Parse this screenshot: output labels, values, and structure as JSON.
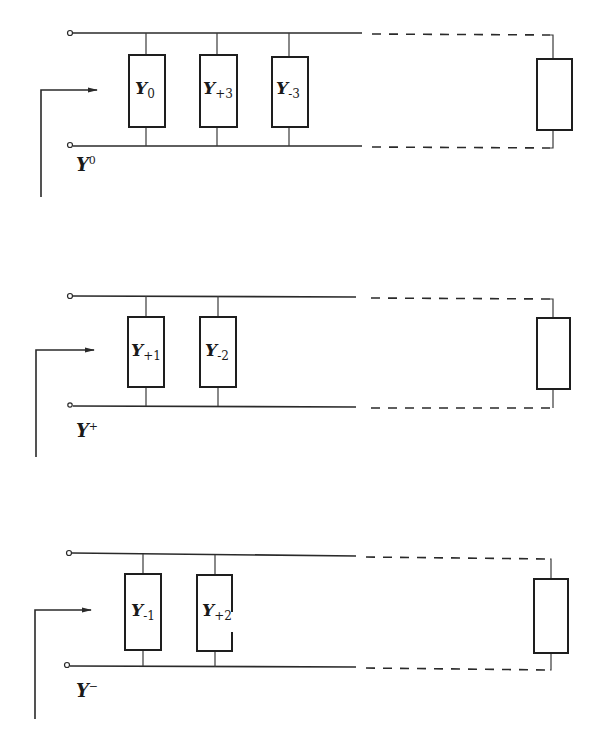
{
  "figure": {
    "networks": [
      {
        "id": "zero",
        "label": {
          "main": "Y",
          "sup": "0"
        },
        "branches": [
          {
            "main": "Y",
            "sub": "0"
          },
          {
            "main": "Y",
            "sub": "+3"
          },
          {
            "main": "Y",
            "sub": "-3"
          }
        ],
        "terminal_box_label": ""
      },
      {
        "id": "positive",
        "label": {
          "main": "Y",
          "sup": "+"
        },
        "branches": [
          {
            "main": "Y",
            "sub": "+1"
          },
          {
            "main": "Y",
            "sub": "-2"
          }
        ],
        "terminal_box_label": ""
      },
      {
        "id": "negative",
        "label": {
          "main": "Y",
          "sup": "−"
        },
        "branches": [
          {
            "main": "Y",
            "sub": "-1"
          },
          {
            "main": "Y",
            "sub": "+2"
          }
        ],
        "terminal_box_label": ""
      }
    ],
    "colors": {
      "line": "#2a2a2a",
      "background": "#ffffff"
    }
  }
}
